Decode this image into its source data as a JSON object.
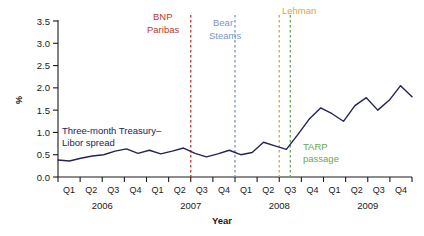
{
  "chart_data": {
    "type": "line",
    "title": "",
    "xlabel": "Year",
    "ylabel": "%",
    "ylim": [
      0.0,
      3.5
    ],
    "yticks": [
      0.0,
      0.5,
      1.0,
      1.5,
      2.0,
      2.5,
      3.0,
      3.5
    ],
    "ytick_labels": [
      "0.0",
      "0.5",
      "1.0",
      "1.5",
      "2.0",
      "2.5",
      "3.0",
      "3.5"
    ],
    "grid": false,
    "legend_position": "inline-annotation",
    "quarter_labels": [
      "Q1",
      "Q2",
      "Q3",
      "Q4",
      "Q1",
      "Q2",
      "Q3",
      "Q4",
      "Q1",
      "Q2",
      "Q3",
      "Q4",
      "Q1",
      "Q2",
      "Q3",
      "Q4"
    ],
    "year_labels": [
      "2006",
      "2007",
      "2008",
      "2009"
    ],
    "series": [
      {
        "name": "Three-month Treasury–Libor spread",
        "color": "#23235c",
        "x": [
          "2006Q1",
          "2006Q1.5",
          "2006Q2",
          "2006Q2.5",
          "2006Q3",
          "2006Q3.5",
          "2006Q4",
          "2006Q4.5",
          "2007Q1",
          "2007Q1.5",
          "2007Q2",
          "2007Q2.5",
          "2007Q3",
          "2007Q3.5",
          "2007Q4",
          "2007Q4.5",
          "2008Q1",
          "2008Q1.5",
          "2008Q2",
          "2008Q2.5",
          "2008Q3",
          "2008Q3.5",
          "2008Q4",
          "2008Q4.5",
          "2009Q1",
          "2009Q1.5",
          "2009Q2",
          "2009Q2.5",
          "2009Q3",
          "2009Q3.5",
          "2009Q4",
          "2009Q4.5"
        ],
        "values": [
          0.38,
          0.36,
          0.42,
          0.47,
          0.5,
          0.58,
          0.63,
          0.53,
          0.6,
          0.52,
          0.58,
          0.65,
          0.53,
          0.45,
          0.52,
          0.6,
          0.5,
          0.55,
          0.78,
          0.7,
          0.62,
          0.95,
          1.3,
          1.55,
          1.42,
          1.25,
          1.6,
          1.78,
          1.5,
          1.72,
          2.05,
          1.8
        ]
      }
    ],
    "annotations": [
      {
        "label": "BNP Paribas",
        "label_lines": [
          "BNP",
          "Paribas"
        ],
        "color": "#c0392b",
        "x_pos": "2007Q3",
        "line_style": "dashed"
      },
      {
        "label": "Bear Steams",
        "label_lines": [
          "Bear",
          "Steams"
        ],
        "color": "#7e93c4",
        "x_pos": "2008Q1",
        "line_style": "dashed"
      },
      {
        "label": "Lehman",
        "label_lines": [
          "Lehman"
        ],
        "color": "#e0a43c",
        "x_pos": "2008Q3",
        "line_style": "dashed"
      },
      {
        "label": "TARP passage",
        "label_lines": [
          "TARP",
          "passage"
        ],
        "color": "#6aa84f",
        "x_pos": "2008Q3.5",
        "line_style": "dashed"
      }
    ],
    "series_inline_label_lines": [
      "Three-month Treasury–",
      "Libor spread"
    ],
    "peak_value": 3.3,
    "peak_label": "Lehman"
  },
  "axis": {
    "y_title": "%",
    "x_title": "Year"
  }
}
